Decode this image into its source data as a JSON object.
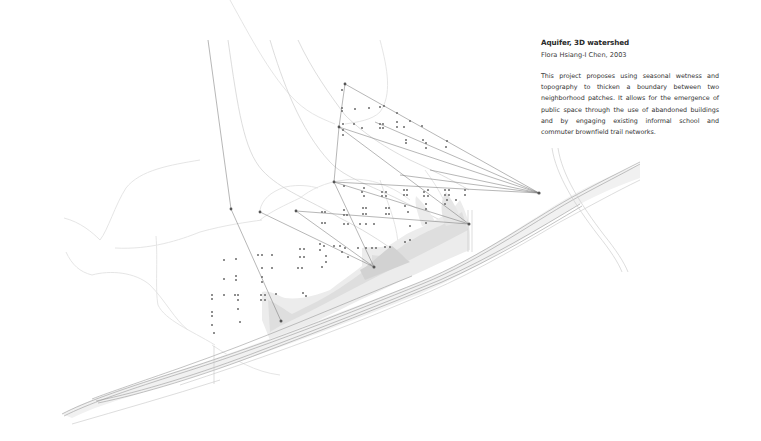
{
  "caption": {
    "title": "Aquifer, 3D watershed",
    "author": "Flora Hsiang-I Chen, 2003",
    "body": "This project proposes using seasonal wetness and topography to thicken a boundary between two neighborhood patches. It allows for the emergence of public space through the use of abandoned buildings and by engaging existing informal school and commuter brownfield trail networks."
  },
  "drawing": {
    "type": "site plan diagram",
    "elements": [
      "contour-lines",
      "building-dots",
      "trail-network-lines",
      "wetland-shading",
      "rail-corridor",
      "road-curve"
    ],
    "colors": {
      "background": "#ffffff",
      "lines": "#7a7a7a",
      "wetland_dark": "#d4d4d4",
      "wetland_light": "#ececec",
      "contours": "#e2e2e2"
    }
  }
}
